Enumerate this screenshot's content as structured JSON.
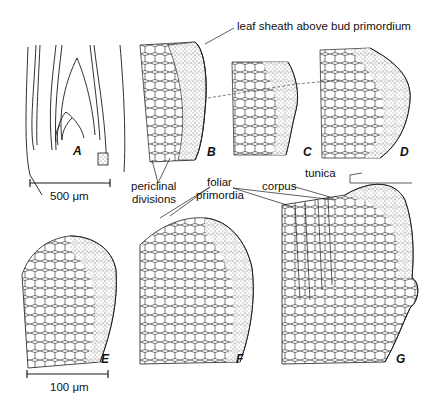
{
  "figure": {
    "panels": [
      {
        "id": "A",
        "label": "A",
        "description": "longitudinal section of shoot with bud"
      },
      {
        "id": "B",
        "label": "B"
      },
      {
        "id": "C",
        "label": "C"
      },
      {
        "id": "D",
        "label": "D"
      },
      {
        "id": "E",
        "label": "E"
      },
      {
        "id": "F",
        "label": "F"
      },
      {
        "id": "G",
        "label": "G"
      }
    ],
    "annotations": {
      "leaf_sheath": "leaf sheath above bud primordium",
      "periclinal_line1": "periclinal",
      "periclinal_line2": "divisions",
      "foliar_line1": "foliar",
      "foliar_line2": "primordia",
      "corpus": "corpus",
      "tunica": "tunica"
    },
    "scale_bars": {
      "large": "500 μm",
      "small": "100 μm"
    },
    "colors": {
      "line": "#1a1a1a",
      "stipple": "#888888",
      "background": "#ffffff"
    }
  }
}
